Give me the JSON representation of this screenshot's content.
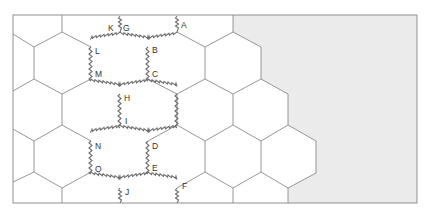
{
  "diagram": {
    "frame": {
      "x": 13,
      "y": 15,
      "width": 404,
      "height": 188
    },
    "colors": {
      "background": "#ffffff",
      "shaded_region": "#ebebeb",
      "grid_line": "#8a8a8a",
      "cut_line": "#6e6e6e"
    },
    "shaded_region_points": "233,15 417,15 417,203 288,203 288,188 316,173 316,141 288,125 288,94 261,79 261,47 233,32",
    "hex_geometry": {
      "half_width": 28.5,
      "side": 32,
      "rise": 15,
      "row_pitch": 47
    },
    "vertex_labels": [
      {
        "id": "A",
        "label": "A",
        "x": 181,
        "y": 28
      },
      {
        "id": "B",
        "label": "B",
        "x": 152,
        "y": 52
      },
      {
        "id": "C",
        "label": "C",
        "x": 152,
        "y": 76
      },
      {
        "id": "D",
        "label": "D",
        "x": 152,
        "y": 148
      },
      {
        "id": "E",
        "label": "E",
        "x": 152,
        "y": 170
      },
      {
        "id": "F",
        "label": "F",
        "x": 181,
        "y": 188
      },
      {
        "id": "G",
        "label": "G",
        "x": 123,
        "y": 30
      },
      {
        "id": "H",
        "label": "H",
        "x": 124,
        "y": 100
      },
      {
        "id": "I",
        "label": "I",
        "x": 125,
        "y": 123
      },
      {
        "id": "J",
        "label": "J",
        "x": 125,
        "y": 194
      },
      {
        "id": "K",
        "label": "K",
        "x": 109,
        "y": 30
      },
      {
        "id": "L",
        "label": "L",
        "x": 95,
        "y": 53
      },
      {
        "id": "M",
        "label": "M",
        "x": 95,
        "y": 76
      },
      {
        "id": "N",
        "label": "N",
        "x": 95,
        "y": 148
      },
      {
        "id": "O",
        "label": "O",
        "x": 95,
        "y": 171
      }
    ]
  }
}
